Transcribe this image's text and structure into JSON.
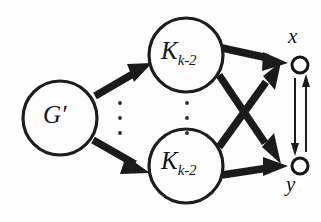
{
  "diagram": {
    "type": "directed-graph",
    "background_color": "#fefefe",
    "stroke_color": "#1b1b1b",
    "nodes": [
      {
        "id": "gprime",
        "label": "G",
        "prime": "′",
        "shape": "circle",
        "style": "large-open-circle",
        "cx": 60,
        "cy": 118,
        "r": 37
      },
      {
        "id": "k-top",
        "label": "K",
        "subscript": "k-2",
        "shape": "circle",
        "style": "large-open-circle",
        "cx": 186,
        "cy": 55,
        "r": 37
      },
      {
        "id": "k-bottom",
        "label": "K",
        "subscript": "k-2",
        "shape": "circle",
        "style": "large-open-circle",
        "cx": 186,
        "cy": 166,
        "r": 37
      },
      {
        "id": "x",
        "label": "x",
        "shape": "circle",
        "style": "small-open-circle",
        "label_position": "above",
        "cx": 300,
        "cy": 65,
        "r": 8
      },
      {
        "id": "y",
        "label": "y",
        "shape": "circle",
        "style": "small-open-circle",
        "label_position": "below",
        "cx": 300,
        "cy": 166,
        "r": 8
      }
    ],
    "edges": [
      {
        "from": "gprime",
        "to": "k-top",
        "style": "thick-arrow"
      },
      {
        "from": "gprime",
        "to": "k-bottom",
        "style": "thick-arrow"
      },
      {
        "from": "k-top",
        "to": "x",
        "style": "thick-arrow"
      },
      {
        "from": "k-top",
        "to": "y",
        "style": "thick-arrow"
      },
      {
        "from": "k-bottom",
        "to": "x",
        "style": "thick-arrow"
      },
      {
        "from": "k-bottom",
        "to": "y",
        "style": "thick-arrow"
      },
      {
        "from": "x",
        "to": "y",
        "style": "thin-arrow"
      },
      {
        "from": "y",
        "to": "x",
        "style": "thin-arrow"
      }
    ],
    "ellipses": [
      {
        "id": "ellipsis-left",
        "orientation": "vertical",
        "dots": 3,
        "cx": 120,
        "cy": 118
      },
      {
        "id": "ellipsis-right",
        "orientation": "vertical",
        "dots": 3,
        "cx": 187,
        "cy": 118
      }
    ]
  }
}
